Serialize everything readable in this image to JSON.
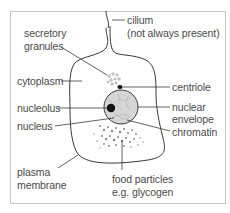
{
  "diagram": {
    "type": "labelled cell diagram",
    "labels": {
      "cilium": "cilium",
      "cilium_note": "(not always present)",
      "secretory_granules_1": "secretory",
      "secretory_granules_2": "granules",
      "cytoplasm": "cytoplasm",
      "centriole": "centriole",
      "nucleolus": "nucleolus",
      "nuclear_envelope_1": "nuclear",
      "nuclear_envelope_2": "envelope",
      "nucleus": "nucleus",
      "chromatin": "chromatin",
      "plasma_membrane_1": "plasma",
      "plasma_membrane_2": "membrane",
      "food_particles_1": "food particles",
      "food_particles_2": "e.g. glycogen"
    },
    "colors": {
      "outline": "#3a3a3a",
      "nucleus_fill": "#d6d6d6",
      "nucleolus_fill": "#111111",
      "granule": "#8a8a8a",
      "text": "#4a4a4a",
      "frame": "#c8c8c8"
    }
  }
}
